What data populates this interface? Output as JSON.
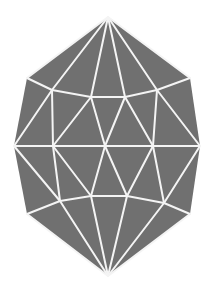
{
  "figure": {
    "fill_color": "#707070",
    "line_color": "#f4f4f4",
    "background_color": "#ffffff",
    "outline": [
      [
        108,
        17
      ],
      [
        190,
        78
      ],
      [
        200,
        146
      ],
      [
        190,
        214
      ],
      [
        108,
        276
      ],
      [
        27,
        214
      ],
      [
        14,
        146
      ],
      [
        27,
        78
      ]
    ],
    "vertices": {
      "top": [
        108,
        17
      ],
      "bottom": [
        108,
        276
      ],
      "upper_outer_left": [
        27,
        78
      ],
      "upper_outer_right": [
        190,
        78
      ],
      "upper_inner": [
        [
          52,
          90
        ],
        [
          91,
          97
        ],
        [
          125,
          97
        ],
        [
          157,
          90
        ]
      ],
      "middle": [
        [
          14,
          146
        ],
        [
          53,
          146
        ],
        [
          105,
          146
        ],
        [
          153,
          146
        ],
        [
          200,
          146
        ]
      ],
      "lower_inner": [
        [
          60,
          201
        ],
        [
          91,
          196
        ],
        [
          127,
          196
        ],
        [
          164,
          203
        ]
      ],
      "lower_outer_left": [
        27,
        214
      ],
      "lower_outer_right": [
        190,
        214
      ]
    },
    "edges": [
      [
        [
          108,
          17
        ],
        [
          27,
          78
        ]
      ],
      [
        [
          108,
          17
        ],
        [
          52,
          90
        ]
      ],
      [
        [
          108,
          17
        ],
        [
          91,
          97
        ]
      ],
      [
        [
          108,
          17
        ],
        [
          125,
          97
        ]
      ],
      [
        [
          108,
          17
        ],
        [
          157,
          90
        ]
      ],
      [
        [
          108,
          17
        ],
        [
          190,
          78
        ]
      ],
      [
        [
          27,
          78
        ],
        [
          52,
          90
        ]
      ],
      [
        [
          52,
          90
        ],
        [
          91,
          97
        ]
      ],
      [
        [
          91,
          97
        ],
        [
          125,
          97
        ]
      ],
      [
        [
          125,
          97
        ],
        [
          157,
          90
        ]
      ],
      [
        [
          157,
          90
        ],
        [
          190,
          78
        ]
      ],
      [
        [
          52,
          90
        ],
        [
          14,
          146
        ]
      ],
      [
        [
          52,
          90
        ],
        [
          53,
          146
        ]
      ],
      [
        [
          91,
          97
        ],
        [
          53,
          146
        ]
      ],
      [
        [
          91,
          97
        ],
        [
          105,
          146
        ]
      ],
      [
        [
          125,
          97
        ],
        [
          105,
          146
        ]
      ],
      [
        [
          125,
          97
        ],
        [
          153,
          146
        ]
      ],
      [
        [
          157,
          90
        ],
        [
          153,
          146
        ]
      ],
      [
        [
          157,
          90
        ],
        [
          200,
          146
        ]
      ],
      [
        [
          14,
          146
        ],
        [
          200,
          146
        ]
      ],
      [
        [
          14,
          146
        ],
        [
          60,
          201
        ]
      ],
      [
        [
          53,
          146
        ],
        [
          60,
          201
        ]
      ],
      [
        [
          53,
          146
        ],
        [
          91,
          196
        ]
      ],
      [
        [
          105,
          146
        ],
        [
          91,
          196
        ]
      ],
      [
        [
          105,
          146
        ],
        [
          127,
          196
        ]
      ],
      [
        [
          153,
          146
        ],
        [
          127,
          196
        ]
      ],
      [
        [
          153,
          146
        ],
        [
          164,
          203
        ]
      ],
      [
        [
          200,
          146
        ],
        [
          164,
          203
        ]
      ],
      [
        [
          27,
          214
        ],
        [
          60,
          201
        ]
      ],
      [
        [
          60,
          201
        ],
        [
          91,
          196
        ]
      ],
      [
        [
          91,
          196
        ],
        [
          127,
          196
        ]
      ],
      [
        [
          127,
          196
        ],
        [
          164,
          203
        ]
      ],
      [
        [
          164,
          203
        ],
        [
          190,
          214
        ]
      ],
      [
        [
          108,
          276
        ],
        [
          27,
          214
        ]
      ],
      [
        [
          108,
          276
        ],
        [
          60,
          201
        ]
      ],
      [
        [
          108,
          276
        ],
        [
          91,
          196
        ]
      ],
      [
        [
          108,
          276
        ],
        [
          127,
          196
        ]
      ],
      [
        [
          108,
          276
        ],
        [
          164,
          203
        ]
      ],
      [
        [
          108,
          276
        ],
        [
          190,
          214
        ]
      ]
    ]
  }
}
